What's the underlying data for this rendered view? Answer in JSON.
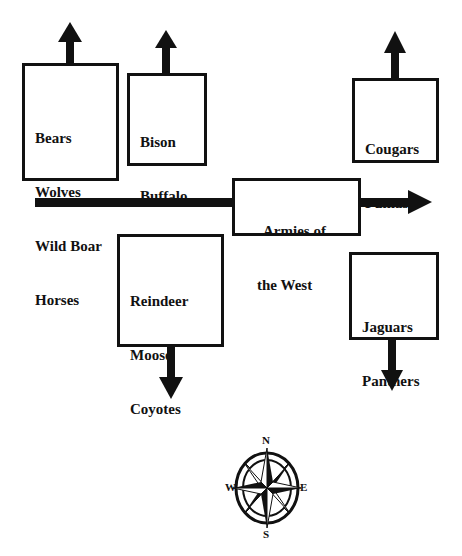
{
  "diagram": {
    "title": "",
    "boxes": [
      {
        "id": "box-bears",
        "lines": [
          "Bears",
          "Wolves",
          "Wild Boar",
          "Horses"
        ],
        "arrow": "up"
      },
      {
        "id": "box-bison",
        "lines": [
          "Bison",
          "Buffalo",
          "Cattle"
        ],
        "arrow": "up"
      },
      {
        "id": "box-cougars",
        "lines": [
          "Cougars",
          "Pumas"
        ],
        "arrow": "up"
      },
      {
        "id": "box-armies",
        "lines": [
          "Armies of",
          "the West"
        ],
        "arrow": "right"
      },
      {
        "id": "box-reindeer",
        "lines": [
          "Reindeer",
          "Moose",
          "Coyotes"
        ],
        "arrow": "down"
      },
      {
        "id": "box-jaguars",
        "lines": [
          "Jaguars",
          "Panthers"
        ],
        "arrow": "down"
      }
    ],
    "compass": {
      "n": "N",
      "s": "S",
      "e": "E",
      "w": "W"
    },
    "colors": {
      "stroke": "#111111",
      "background": "#ffffff"
    }
  }
}
